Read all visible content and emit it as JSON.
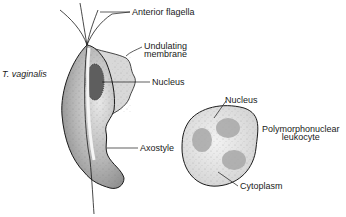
{
  "figure": {
    "organism_label": "T. vaginalis",
    "trichomonas_labels": {
      "anterior_flagella": "Anterior flagella",
      "undulating_membrane_line1": "Undulating",
      "undulating_membrane_line2": "membrane",
      "nucleus": "Nucleus",
      "axostyle": "Axostyle"
    },
    "leukocyte_labels": {
      "nucleus": "Nucleus",
      "cell_name_line1": "Polymorphonuclear",
      "cell_name_line2": "leukocyte",
      "cytoplasm": "Cytoplasm"
    },
    "colors": {
      "outline": "#1a1a1a",
      "cell_fill": "#b8b8b8",
      "cell_light": "#e6e6e6",
      "nucleus_fill": "#6e6e6e",
      "leuko_fill": "#e4e4e4",
      "leuko_nucleus": "#b0b0b0"
    }
  }
}
